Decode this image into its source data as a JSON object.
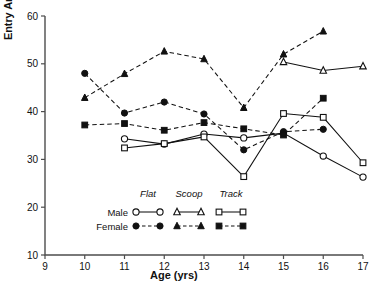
{
  "chart_data": {
    "type": "line",
    "title": "",
    "xlabel": "Age (yrs)",
    "ylabel": "Entry Angle (degree)",
    "xlim": [
      9,
      17
    ],
    "ylim": [
      10,
      60
    ],
    "xticks": [
      9,
      10,
      11,
      12,
      13,
      14,
      15,
      16,
      17
    ],
    "yticks": [
      10,
      20,
      30,
      40,
      50,
      60
    ],
    "grid": false,
    "legend_position": "inside-lower-left",
    "legend": {
      "column_headers": [
        "Flat",
        "Scoop",
        "Track"
      ],
      "row_labels": [
        "Male",
        "Female"
      ],
      "row_styles": [
        "open symbols, solid line",
        "filled symbols, dashed line"
      ],
      "entries": [
        {
          "label": "Male Flat",
          "marker": "open-circle",
          "line": "solid"
        },
        {
          "label": "Male Scoop",
          "marker": "open-triangle",
          "line": "solid"
        },
        {
          "label": "Male Track",
          "marker": "open-square",
          "line": "solid"
        },
        {
          "label": "Female Flat",
          "marker": "filled-circle",
          "line": "dashed"
        },
        {
          "label": "Female Scoop",
          "marker": "filled-triangle",
          "line": "dashed"
        },
        {
          "label": "Female Track",
          "marker": "filled-square",
          "line": "dashed"
        }
      ]
    },
    "series": [
      {
        "name": "Male Flat",
        "marker": "open-circle",
        "line": "solid",
        "x": [
          11,
          12,
          13,
          14,
          15,
          16,
          17
        ],
        "values": [
          34.3,
          33.2,
          35.3,
          34.5,
          35.5,
          30.7,
          26.3
        ]
      },
      {
        "name": "Male Scoop",
        "marker": "open-triangle",
        "line": "solid",
        "x": [
          15,
          16,
          17
        ],
        "values": [
          50.4,
          48.6,
          49.5
        ]
      },
      {
        "name": "Male Track",
        "marker": "open-square",
        "line": "solid",
        "x": [
          11,
          12,
          13,
          14,
          15,
          16,
          17
        ],
        "values": [
          32.4,
          33.3,
          34.7,
          26.4,
          39.6,
          38.8,
          29.3
        ]
      },
      {
        "name": "Female Flat",
        "marker": "filled-circle",
        "line": "dashed",
        "x": [
          10,
          11,
          12,
          13,
          14,
          15,
          16
        ],
        "values": [
          48.0,
          39.7,
          42.0,
          39.5,
          32.0,
          35.8,
          36.3
        ]
      },
      {
        "name": "Female Scoop",
        "marker": "filled-triangle",
        "line": "dashed",
        "x": [
          10,
          11,
          12,
          13,
          14,
          15,
          16
        ],
        "values": [
          42.9,
          47.9,
          52.6,
          51.0,
          40.8,
          52.0,
          56.8
        ]
      },
      {
        "name": "Female Track",
        "marker": "filled-square",
        "line": "dashed",
        "x": [
          10,
          11,
          12,
          13,
          14,
          15,
          16
        ],
        "values": [
          37.2,
          37.5,
          36.1,
          37.7,
          36.4,
          35.1,
          42.8
        ]
      }
    ]
  }
}
